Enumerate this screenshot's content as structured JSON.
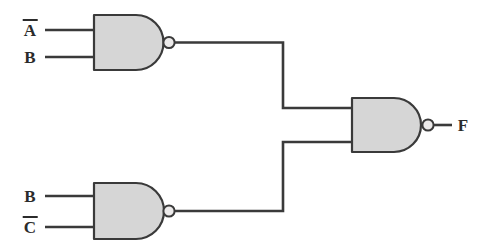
{
  "diagram": {
    "type": "logic-circuit",
    "colors": {
      "gate_fill": "#d6d6d6",
      "line": "#3a3a3a",
      "background": "#ffffff",
      "text": "#2b2b2b"
    },
    "inputs": [
      {
        "id": "in-a-not",
        "label": "A",
        "overline": true,
        "text": "Ā",
        "gate": "nand-gate-1",
        "pin": "top"
      },
      {
        "id": "in-b-1",
        "label": "B",
        "overline": false,
        "text": "B",
        "gate": "nand-gate-1",
        "pin": "bottom"
      },
      {
        "id": "in-b-2",
        "label": "B",
        "overline": false,
        "text": "B",
        "gate": "nand-gate-2",
        "pin": "top"
      },
      {
        "id": "in-c-not",
        "label": "C",
        "overline": true,
        "text": "C̄",
        "gate": "nand-gate-2",
        "pin": "bottom"
      }
    ],
    "gates": [
      {
        "id": "nand-gate-1",
        "type": "NAND",
        "inputs": [
          "Ā",
          "B"
        ],
        "output": "nand-gate-3"
      },
      {
        "id": "nand-gate-2",
        "type": "NAND",
        "inputs": [
          "B",
          "C̄"
        ],
        "output": "nand-gate-3"
      },
      {
        "id": "nand-gate-3",
        "type": "NAND",
        "inputs": [
          "nand-gate-1",
          "nand-gate-2"
        ],
        "output": "F"
      }
    ],
    "outputs": [
      {
        "id": "out-f",
        "label": "F",
        "overline": false,
        "text": "F",
        "gate": "nand-gate-3"
      }
    ]
  }
}
